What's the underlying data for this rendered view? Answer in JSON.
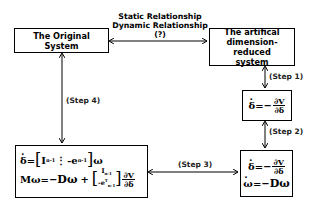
{
  "top_relationship": {
    "line1": "Static Relationship",
    "line2": "Dynamic Relationship",
    "line3": "(?)"
  },
  "boxes": {
    "original": {
      "label": "The Original System"
    },
    "artificial": {
      "line1": "The artifical",
      "line2": "dimension-reduced",
      "line3": "system"
    },
    "step1_eq": {
      "lhs": "δ",
      "eq": "=−",
      "num": "∂V",
      "den": "∂δ"
    },
    "step2_eq": {
      "row1": {
        "lhs": "δ",
        "eq": "=−",
        "num": "∂V",
        "den": "∂δ"
      },
      "row2": {
        "lhs": "ω",
        "eq": "=−",
        "rhs": "Dω"
      }
    },
    "step4_eq": {
      "row1": {
        "lhs": "δ",
        "eq": "=",
        "m1": "I",
        "m1sub": "n-1",
        "sep": "⋮",
        "m2": "-e",
        "m2sub": "n-1",
        "rhs": "ω"
      },
      "row2": {
        "lhs": "Mω",
        "eq": "=−",
        "term1": "Dω",
        "plus": "+",
        "v1": "I",
        "v1sub": "n-1",
        "v2": "-e",
        "v2sup": "T",
        "v2sub": "n-1",
        "num": "∂V",
        "den": "∂δ"
      }
    }
  },
  "steps": {
    "step1": "(Step 1)",
    "step2": "(Step 2)",
    "step3": "(Step 3)",
    "step4": "(Step 4)"
  }
}
